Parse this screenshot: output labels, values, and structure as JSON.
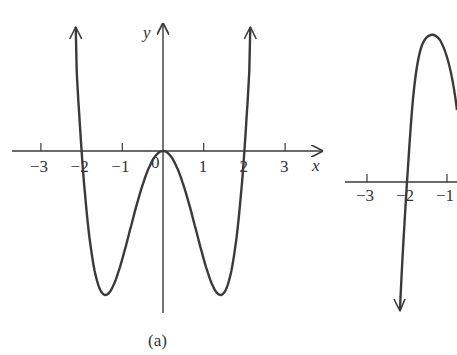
{
  "chart_data": [
    {
      "type": "line",
      "panel_label": "(a)",
      "xlabel": "x",
      "ylabel": "y",
      "x_tick_labels": [
        "−3",
        "−2",
        "−1",
        "0",
        "1",
        "2",
        "3"
      ],
      "x_ticks": [
        -3,
        -2,
        -1,
        0,
        1,
        2,
        3
      ],
      "xlim": [
        -3.7,
        3.8
      ],
      "grid": false,
      "description": "W-shaped quartic: zeros at x=-2, 0 (double), 2; local minima near x=±1.41; arrows upward at both ends",
      "series": [
        {
          "name": "f(x)",
          "x": [
            -2.12,
            -2,
            -1.8,
            -1.6,
            -1.41,
            -1.2,
            -1,
            -0.8,
            -0.5,
            -0.25,
            0,
            0.25,
            0.5,
            0.8,
            1,
            1.2,
            1.41,
            1.6,
            1.8,
            2,
            2.12
          ],
          "y_relative": [
            0.5,
            0,
            -0.6,
            -0.92,
            -1,
            -0.91,
            -0.75,
            -0.54,
            -0.23,
            -0.06,
            0,
            -0.06,
            -0.23,
            -0.54,
            -0.75,
            -0.91,
            -1,
            -0.92,
            -0.6,
            0,
            0.5
          ]
        }
      ]
    },
    {
      "type": "line",
      "panel_label": "(b)",
      "partial": true,
      "x_tick_labels": [
        "−3",
        "−2",
        "−1"
      ],
      "x_ticks": [
        -3,
        -2,
        -1
      ],
      "grid": false,
      "description": "Partially visible curve crossing x-axis at x=-2, arrow downward at left, local max near x=-1.4",
      "series": [
        {
          "name": "g(x)",
          "x": [
            -2.2,
            -2,
            -1.8,
            -1.6,
            -1.4,
            -1.2,
            -1.0
          ],
          "y_relative": [
            -1.0,
            0,
            0.75,
            1.15,
            1.2,
            1.05,
            0.7
          ]
        }
      ]
    }
  ]
}
